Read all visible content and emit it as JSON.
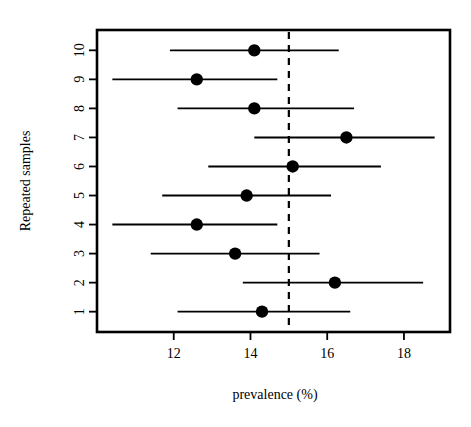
{
  "chart_data": {
    "type": "scatter",
    "title": "",
    "subtitle": "",
    "xlabel": "prevalence (%)",
    "ylabel": "Repeated samples",
    "xlim": [
      10.0,
      19.2
    ],
    "ylim": [
      0.3,
      10.7
    ],
    "grid": false,
    "legend": null,
    "xticks": [
      "12",
      "14",
      "16",
      "18"
    ],
    "xtick_values": [
      12,
      14,
      16,
      18
    ],
    "yticks": [
      "1",
      "2",
      "3",
      "4",
      "5",
      "6",
      "7",
      "8",
      "9",
      "10"
    ],
    "ytick_values": [
      1,
      2,
      3,
      4,
      5,
      6,
      7,
      8,
      9,
      10
    ],
    "reference_line": {
      "orientation": "vertical",
      "value": 15,
      "style": "dashed",
      "color": "#000000"
    },
    "series": [
      {
        "name": "prevalence estimate with confidence interval",
        "marker": "filled-circle",
        "color": "#000000",
        "points": [
          {
            "sample": 1,
            "estimate": 14.3,
            "low": 12.1,
            "high": 16.6
          },
          {
            "sample": 2,
            "estimate": 16.2,
            "low": 13.8,
            "high": 18.5
          },
          {
            "sample": 3,
            "estimate": 13.6,
            "low": 11.4,
            "high": 15.8
          },
          {
            "sample": 4,
            "estimate": 12.6,
            "low": 10.4,
            "high": 14.7
          },
          {
            "sample": 5,
            "estimate": 13.9,
            "low": 11.7,
            "high": 16.1
          },
          {
            "sample": 6,
            "estimate": 15.1,
            "low": 12.9,
            "high": 17.4
          },
          {
            "sample": 7,
            "estimate": 16.5,
            "low": 14.1,
            "high": 18.8
          },
          {
            "sample": 8,
            "estimate": 14.1,
            "low": 12.1,
            "high": 16.7
          },
          {
            "sample": 9,
            "estimate": 12.6,
            "low": 10.4,
            "high": 14.7
          },
          {
            "sample": 10,
            "estimate": 14.1,
            "low": 11.9,
            "high": 16.3
          }
        ]
      }
    ]
  },
  "axes": {
    "x_title": "prevalence (%)",
    "y_title": "Repeated samples"
  },
  "colors": {
    "foreground": "#000000",
    "background": "#ffffff"
  }
}
